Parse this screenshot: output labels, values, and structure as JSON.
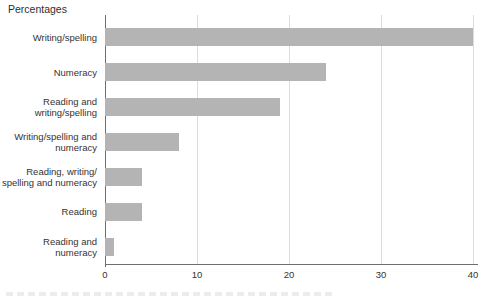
{
  "chart_data": {
    "type": "bar",
    "orientation": "horizontal",
    "title": "Percentages",
    "categories": [
      "Writing/spelling",
      "Numeracy",
      "Reading and writing/spelling",
      "Writing/spelling and numeracy",
      "Reading, writing/spelling and numeracy",
      "Reading",
      "Reading and numeracy"
    ],
    "category_lines": [
      [
        "Writing/spelling"
      ],
      [
        "Numeracy"
      ],
      [
        "Reading and",
        "writing/spelling"
      ],
      [
        "Writing/spelling and",
        "numeracy"
      ],
      [
        "Reading, writing/",
        "spelling and numeracy"
      ],
      [
        "Reading"
      ],
      [
        "Reading and numeracy"
      ]
    ],
    "values": [
      40,
      24,
      19,
      8,
      4,
      4,
      1
    ],
    "xlabel": "",
    "ylabel": "",
    "xlim": [
      0,
      40
    ],
    "x_ticks": [
      0,
      10,
      20,
      30,
      40
    ],
    "grid": true,
    "legend": "none",
    "colors": {
      "bar": "#b4b4b4",
      "gridline": "#dcdcdc",
      "axis": "#6e6e6e",
      "text": "#333333"
    }
  }
}
